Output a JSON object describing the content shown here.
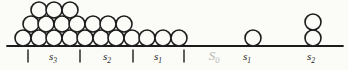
{
  "diagram": {
    "ink_color": "#1c1c1c",
    "muted_color": "#b7b7b2",
    "paper_color": "#fbfbf8",
    "circle_radius": 8,
    "circle_stroke_width": 1.6,
    "ground_line": {
      "x1": 7,
      "x2": 343,
      "y": 46,
      "stroke_width": 1.8
    },
    "tick_top": 50,
    "tick_bottom": 62,
    "tick_stroke_width": 1.4,
    "ticks": [
      {
        "x": 28
      },
      {
        "x": 80
      },
      {
        "x": 133
      },
      {
        "x": 184
      }
    ],
    "circle_groups": [
      {
        "name": "pile-bottom-row",
        "y": 38,
        "xs": [
          23,
          39,
          54,
          70,
          85,
          101,
          116,
          132,
          147,
          163,
          179
        ]
      },
      {
        "name": "pile-middle-row",
        "y": 24,
        "xs": [
          31,
          46,
          62,
          77,
          93,
          108,
          124
        ]
      },
      {
        "name": "pile-top-row",
        "y": 10,
        "xs": [
          39,
          54,
          70
        ]
      },
      {
        "name": "single-ball",
        "y": 38,
        "xs": [
          253
        ]
      },
      {
        "name": "stacked-pair-bottom",
        "y": 38,
        "xs": [
          313
        ]
      },
      {
        "name": "stacked-pair-top",
        "y": 22,
        "xs": [
          313
        ]
      }
    ],
    "label_font_size": 11,
    "label_sub_font_size": 7.5,
    "muted_label_font_size": 13,
    "muted_label_sub_font_size": 8.5,
    "labels": [
      {
        "base": "s",
        "sub": "3",
        "x": 53,
        "y": 60,
        "muted": false
      },
      {
        "base": "s",
        "sub": "2",
        "x": 107,
        "y": 60,
        "muted": false
      },
      {
        "base": "s",
        "sub": "1",
        "x": 158,
        "y": 60,
        "muted": false
      },
      {
        "base": "S",
        "sub": "0",
        "x": 214,
        "y": 60,
        "muted": true
      },
      {
        "base": "s",
        "sub": "1",
        "x": 247,
        "y": 60,
        "muted": false
      },
      {
        "base": "s",
        "sub": "2",
        "x": 311,
        "y": 60,
        "muted": false
      }
    ]
  }
}
